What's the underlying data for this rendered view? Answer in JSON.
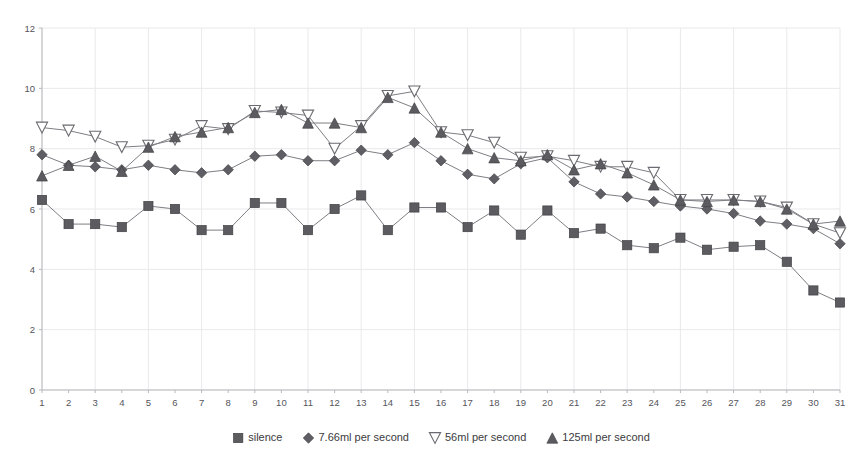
{
  "chart_data": {
    "type": "line",
    "title": "",
    "xlabel": "",
    "ylabel": "",
    "xlim": [
      1,
      31
    ],
    "ylim": [
      0,
      12
    ],
    "ytick_labels": [
      "0",
      "2",
      "4",
      "6",
      "8",
      "10",
      "12"
    ],
    "ytick_values": [
      0,
      2,
      4,
      6,
      8,
      10,
      12
    ],
    "grid": true,
    "legend_position": "bottom",
    "x": [
      1,
      2,
      3,
      4,
      5,
      6,
      7,
      8,
      9,
      10,
      11,
      12,
      13,
      14,
      15,
      16,
      17,
      18,
      19,
      20,
      21,
      22,
      23,
      24,
      25,
      26,
      27,
      28,
      29,
      30,
      31
    ],
    "xtick_labels": [
      "1",
      "2",
      "3",
      "4",
      "5",
      "6",
      "7",
      "8",
      "9",
      "10",
      "11",
      "12",
      "13",
      "14",
      "15",
      "16",
      "17",
      "18",
      "19",
      "20",
      "21",
      "22",
      "23",
      "24",
      "25",
      "26",
      "27",
      "28",
      "29",
      "30",
      "31"
    ],
    "series": [
      {
        "name": "silence",
        "marker": "square-filled",
        "values": [
          6.3,
          5.5,
          5.5,
          5.4,
          6.1,
          6.0,
          5.3,
          5.3,
          6.2,
          6.2,
          5.3,
          6.0,
          6.45,
          5.3,
          6.05,
          6.05,
          5.4,
          5.95,
          5.15,
          5.95,
          5.2,
          5.35,
          4.8,
          4.7,
          5.05,
          4.65,
          4.75,
          4.8,
          4.25,
          3.3,
          2.9
        ]
      },
      {
        "name": "7.66ml per second",
        "marker": "diamond-filled",
        "values": [
          7.8,
          7.45,
          7.4,
          7.3,
          7.45,
          7.3,
          7.2,
          7.3,
          7.75,
          7.8,
          7.6,
          7.6,
          7.95,
          7.8,
          8.2,
          7.6,
          7.15,
          7.0,
          7.5,
          7.7,
          6.9,
          6.5,
          6.4,
          6.25,
          6.1,
          6.0,
          5.85,
          5.6,
          5.5,
          5.35,
          4.85
        ]
      },
      {
        "name": "56ml per second",
        "marker": "triangle-down-open",
        "values": [
          8.7,
          8.6,
          8.4,
          8.05,
          8.1,
          8.3,
          8.75,
          8.65,
          9.25,
          9.2,
          9.1,
          8.0,
          8.75,
          9.75,
          9.9,
          8.55,
          8.45,
          8.2,
          7.7,
          7.75,
          7.6,
          7.4,
          7.4,
          7.2,
          6.3,
          6.3,
          6.3,
          6.25,
          6.05,
          5.5,
          5.2
        ]
      },
      {
        "name": "125ml per second",
        "marker": "triangle-up-filled",
        "values": [
          7.1,
          7.45,
          7.75,
          7.25,
          8.05,
          8.4,
          8.55,
          8.7,
          9.2,
          9.3,
          8.85,
          8.85,
          8.7,
          9.7,
          9.35,
          8.55,
          8.0,
          7.7,
          7.6,
          7.8,
          7.3,
          7.5,
          7.2,
          6.8,
          6.3,
          6.25,
          6.3,
          6.25,
          6.0,
          5.5,
          5.6
        ]
      }
    ]
  },
  "legend": {
    "items": [
      {
        "label": "silence",
        "marker": "square-filled"
      },
      {
        "label": "7.66ml per second",
        "marker": "diamond-filled"
      },
      {
        "label": "56ml per second",
        "marker": "triangle-down-open"
      },
      {
        "label": "125ml per second",
        "marker": "triangle-up-filled"
      }
    ]
  },
  "colors": {
    "marker_fill": "#5b5b60",
    "marker_stroke": "#404045",
    "line": "#7e7e84",
    "grid": "#e9e9ec",
    "axis": "#b9b9bd",
    "text": "#55545a",
    "background": "#ffffff"
  }
}
